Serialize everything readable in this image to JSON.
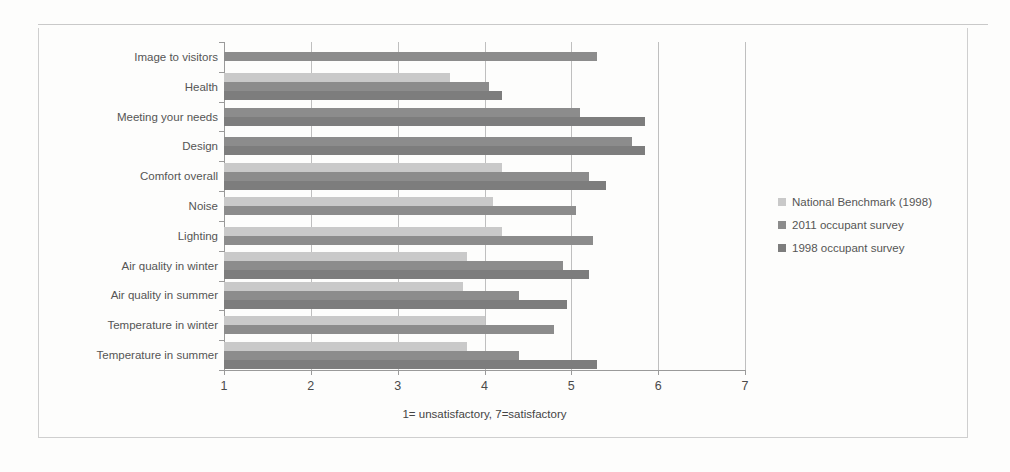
{
  "chart_data": {
    "type": "bar",
    "orientation": "horizontal",
    "title": "",
    "xlabel": "1= unsatisfactory,  7=satisfactory",
    "ylabel": "",
    "xlim": [
      1,
      7
    ],
    "xticks": [
      "1",
      "2",
      "3",
      "4",
      "5",
      "6",
      "7"
    ],
    "grid": true,
    "legend_position": "right",
    "categories": [
      "Image to visitors",
      "Health",
      "Meeting your needs",
      "Design",
      "Comfort overall",
      "Noise",
      "Lighting",
      "Air quality in winter",
      "Air quality in summer",
      "Temperature in winter",
      "Temperature in summer"
    ],
    "series": [
      {
        "name": "National Benchmark (1998)",
        "color": "#c9c9c9",
        "values": [
          null,
          3.6,
          null,
          null,
          4.2,
          4.1,
          4.2,
          3.8,
          3.75,
          4.0,
          3.8
        ]
      },
      {
        "name": "2011 occupant survey",
        "color": "#8c8c8c",
        "values": [
          5.3,
          4.05,
          5.1,
          5.7,
          5.2,
          5.05,
          5.25,
          4.9,
          4.4,
          4.8,
          4.4
        ]
      },
      {
        "name": "1998 occupant survey",
        "color": "#7d7d7d",
        "values": [
          null,
          4.2,
          5.85,
          5.85,
          5.4,
          null,
          null,
          5.2,
          4.95,
          null,
          5.3
        ]
      }
    ]
  },
  "legend": {
    "items": [
      {
        "label": "National Benchmark (1998)",
        "color": "#c9c9c9"
      },
      {
        "label": "2011 occupant survey",
        "color": "#8c8c8c"
      },
      {
        "label": "1998 occupant survey",
        "color": "#7d7d7d"
      }
    ]
  }
}
